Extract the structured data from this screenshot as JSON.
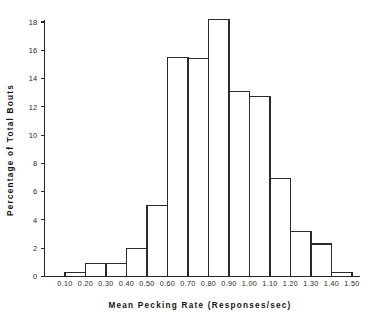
{
  "chart_data": {
    "type": "bar",
    "title": "",
    "subtitle": "",
    "xlabel": "Mean Pecking Rate (Responses/sec)",
    "ylabel": "Percentage of Total Bouts",
    "grid": false,
    "legend": "none",
    "xlim": [
      0.0,
      1.5
    ],
    "ylim": [
      0,
      18.8
    ],
    "bin_width": 0.1,
    "bin_edges": [
      0.0,
      0.1,
      0.2,
      0.3,
      0.4,
      0.5,
      0.6,
      0.7,
      0.8,
      0.9,
      1.0,
      1.1,
      1.2,
      1.3,
      1.4,
      1.5
    ],
    "categories": [
      "0.00-0.10",
      "0.10-0.20",
      "0.20-0.30",
      "0.30-0.40",
      "0.40-0.50",
      "0.50-0.60",
      "0.60-0.70",
      "0.70-0.80",
      "0.80-0.90",
      "0.90-1.00",
      "1.00-1.10",
      "1.10-1.20",
      "1.20-1.30",
      "1.30-1.40",
      "1.40-1.50"
    ],
    "values": [
      0.0,
      0.3,
      0.9,
      0.9,
      2.0,
      5.0,
      15.5,
      15.4,
      18.2,
      13.1,
      12.7,
      6.9,
      3.2,
      2.3,
      0.3
    ],
    "xticks": [
      0.1,
      0.2,
      0.3,
      0.4,
      0.5,
      0.6,
      0.7,
      0.8,
      0.9,
      1.0,
      1.1,
      1.2,
      1.3,
      1.4,
      1.5
    ],
    "xtick_labels": [
      "0.10",
      "0.20",
      "0.30",
      "0.40",
      "0.50",
      "0.60",
      "0.70",
      "0.80",
      "0.90",
      "1.00",
      "1.10",
      "1.20",
      "1.30",
      "1.40",
      "1.50"
    ],
    "yticks": [
      0,
      2,
      4,
      6,
      8,
      10,
      12,
      14,
      16,
      18
    ],
    "ytick_labels": [
      "0",
      "2",
      "4",
      "6",
      "8",
      "10",
      "12",
      "14",
      "16",
      "18"
    ],
    "colors": {
      "bar_stroke": "#2b2b2b",
      "bar_fill": "none",
      "axis": "#262626",
      "text": "#1f1f1f",
      "background": "#ffffff"
    }
  }
}
